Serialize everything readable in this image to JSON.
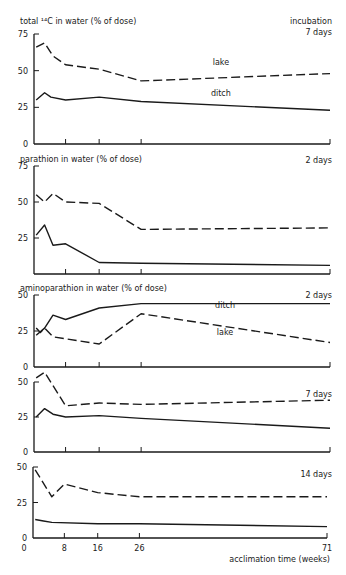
{
  "figure": {
    "xlabel": "acclimation time (weeks)",
    "x_ticks": [
      0,
      8,
      16,
      26,
      71
    ],
    "x_range": [
      0,
      71
    ],
    "incubation_label": "incubation"
  },
  "chart_data": [
    {
      "type": "line",
      "title": "total ¹⁴C in water (% of dose)",
      "incubation": "7 days",
      "ylabel": "total 14C in water (% of dose)",
      "xlabel": "acclimation time (weeks)",
      "ylim": [
        0,
        75
      ],
      "y_ticks": [
        0,
        25,
        50,
        75
      ],
      "x_ticks": [
        8,
        16,
        26,
        71
      ],
      "grid": false,
      "series": [
        {
          "name": "lake",
          "style": "dashed",
          "points": [
            [
              1,
              66
            ],
            [
              3,
              69
            ],
            [
              5,
              60
            ],
            [
              8,
              54
            ],
            [
              16,
              51
            ],
            [
              26,
              43
            ],
            [
              71,
              48
            ]
          ]
        },
        {
          "name": "ditch",
          "style": "solid",
          "points": [
            [
              1,
              30
            ],
            [
              3,
              35
            ],
            [
              4.5,
              32
            ],
            [
              8,
              30
            ],
            [
              16,
              32
            ],
            [
              26,
              29
            ],
            [
              71,
              23
            ]
          ]
        }
      ],
      "annotations": [
        {
          "text": "lake",
          "x": 45,
          "y": 54
        },
        {
          "text": "ditch",
          "x": 45,
          "y": 33
        }
      ]
    },
    {
      "type": "line",
      "title": "parathion in water (% of dose)",
      "incubation": "2 days",
      "ylabel": "parathion in water (% of dose)",
      "ylim": [
        0,
        75
      ],
      "y_ticks": [
        25,
        50,
        75
      ],
      "x_ticks": [
        8,
        16,
        26,
        71
      ],
      "grid": false,
      "series": [
        {
          "name": "lake",
          "style": "dashed",
          "points": [
            [
              1,
              55
            ],
            [
              3,
              50
            ],
            [
              5,
              56
            ],
            [
              8,
              50
            ],
            [
              16,
              49
            ],
            [
              26,
              31
            ],
            [
              71,
              32
            ]
          ]
        },
        {
          "name": "ditch",
          "style": "solid",
          "points": [
            [
              1,
              27
            ],
            [
              3,
              34
            ],
            [
              5,
              20
            ],
            [
              8,
              21
            ],
            [
              16,
              8
            ],
            [
              26,
              7.5
            ],
            [
              71,
              6
            ]
          ]
        }
      ]
    },
    {
      "type": "line",
      "title": "aminoparathion in water (% of dose)",
      "incubation": "2 days",
      "ylabel": "aminoparathion in water (% of dose)",
      "ylim": [
        0,
        50
      ],
      "y_ticks": [
        0,
        25,
        50
      ],
      "x_ticks": [
        8,
        16,
        26,
        71
      ],
      "grid": false,
      "series": [
        {
          "name": "ditch",
          "style": "solid",
          "points": [
            [
              1,
              22
            ],
            [
              3,
              27
            ],
            [
              5,
              36
            ],
            [
              8,
              33
            ],
            [
              16,
              41
            ],
            [
              26,
              44
            ],
            [
              71,
              44
            ]
          ]
        },
        {
          "name": "lake",
          "style": "dashed",
          "points": [
            [
              1,
              27
            ],
            [
              2,
              24
            ],
            [
              3,
              27
            ],
            [
              5,
              21
            ],
            [
              16,
              16
            ],
            [
              26,
              37
            ],
            [
              71,
              17
            ]
          ]
        }
      ],
      "annotations": [
        {
          "text": "ditch",
          "x": 46,
          "y": 41
        },
        {
          "text": "lake",
          "x": 46,
          "y": 22
        }
      ]
    },
    {
      "type": "line",
      "title": "",
      "incubation": "7 days",
      "ylim": [
        0,
        50
      ],
      "y_ticks": [
        0,
        25,
        50
      ],
      "x_ticks": [
        8,
        16,
        26,
        71
      ],
      "grid": false,
      "series": [
        {
          "name": "lake",
          "style": "dashed",
          "points": [
            [
              1,
              53
            ],
            [
              3,
              57
            ],
            [
              8,
              33
            ],
            [
              16,
              35
            ],
            [
              26,
              34
            ],
            [
              71,
              37
            ]
          ]
        },
        {
          "name": "ditch",
          "style": "solid",
          "points": [
            [
              1,
              25
            ],
            [
              3,
              31
            ],
            [
              5,
              27
            ],
            [
              8,
              25
            ],
            [
              16,
              26
            ],
            [
              26,
              24
            ],
            [
              71,
              17
            ]
          ]
        }
      ]
    },
    {
      "type": "line",
      "title": "",
      "incubation": "14 days",
      "ylim": [
        0,
        50
      ],
      "y_ticks": [
        0,
        25,
        50
      ],
      "x_ticks": [
        0,
        8,
        16,
        26,
        71
      ],
      "xlabel": "acclimation time (weeks)",
      "grid": false,
      "series": [
        {
          "name": "lake",
          "style": "dashed",
          "points": [
            [
              1,
              48
            ],
            [
              5,
              29
            ],
            [
              8,
              38
            ],
            [
              16,
              32
            ],
            [
              26,
              29
            ],
            [
              71,
              29
            ]
          ]
        },
        {
          "name": "ditch",
          "style": "solid",
          "points": [
            [
              1,
              13
            ],
            [
              3,
              12
            ],
            [
              5,
              11
            ],
            [
              16,
              10
            ],
            [
              26,
              10
            ],
            [
              71,
              8
            ]
          ]
        }
      ]
    }
  ],
  "layout": {
    "panels": [
      {
        "top": 34,
        "bottom": 144,
        "x0": 32,
        "x71": 330,
        "title_y": 24,
        "inc_y1": 24,
        "inc_y2": 35,
        "show_incubation_word": true
      },
      {
        "top": 166,
        "bottom": 274,
        "x0": 32,
        "x71": 330,
        "title_y": 162,
        "inc_y2": 163
      },
      {
        "top": 295,
        "bottom": 367,
        "x0": 32,
        "x71": 330,
        "title_y": 291,
        "inc_y2": 298
      },
      {
        "top": 382,
        "bottom": 452,
        "x0": 32,
        "x71": 330,
        "title_y": null,
        "inc_y2": 397
      },
      {
        "top": 467,
        "bottom": 538,
        "x0": 31,
        "x71": 327,
        "title_y": null,
        "inc_y2": 477
      }
    ]
  }
}
